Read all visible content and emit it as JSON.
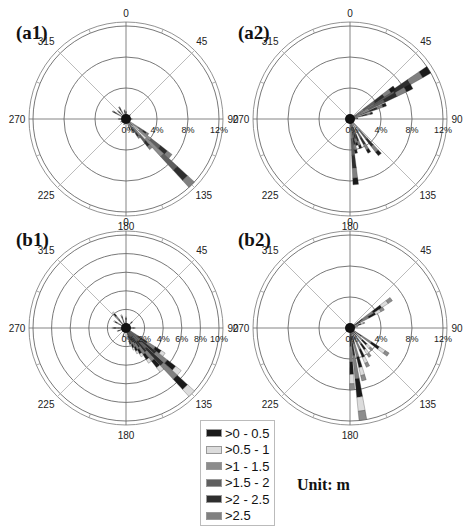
{
  "panels": [
    {
      "id": "a1",
      "label": "(a1)"
    },
    {
      "id": "a2",
      "label": "(a2)"
    },
    {
      "id": "b1",
      "label": "(b1)"
    },
    {
      "id": "b2",
      "label": "(b2)"
    }
  ],
  "legend": {
    "items": [
      {
        "label": ">0 - 0.5",
        "color": "#1a1a1a"
      },
      {
        "label": ">0.5 - 1",
        "color": "#dcdcdc"
      },
      {
        "label": ">1 - 1.5",
        "color": "#8c8c8c"
      },
      {
        "label": ">1.5 - 2",
        "color": "#5f5f5f"
      },
      {
        "label": ">2 - 2.5",
        "color": "#2e2e2e"
      },
      {
        "label": ">2.5",
        "color": "#808080"
      }
    ]
  },
  "unit_label": "Unit: m",
  "chart_data": [
    {
      "type": "rose",
      "title": "(a1)",
      "angle_labels": [
        "0",
        "45",
        "90",
        "135",
        "180",
        "225",
        "270",
        "315"
      ],
      "radial_tick_labels": [
        "0%",
        "4%",
        "8%",
        "12%"
      ],
      "rmax": 12,
      "legend": [
        ">0 - 0.5",
        ">0.5 - 1",
        ">1 - 1.5",
        ">1.5 - 2",
        ">2 - 2.5",
        ">2.5"
      ],
      "dominant_direction_deg": 135,
      "bins": [
        {
          "dir": 135,
          "freq": 12.0
        },
        {
          "dir": 130,
          "freq": 7.5
        },
        {
          "dir": 140,
          "freq": 5.0
        },
        {
          "dir": 125,
          "freq": 3.5
        },
        {
          "dir": 145,
          "freq": 3.0
        },
        {
          "dir": 150,
          "freq": 2.0
        },
        {
          "dir": 160,
          "freq": 1.5
        },
        {
          "dir": 315,
          "freq": 1.5
        },
        {
          "dir": 300,
          "freq": 2.0
        },
        {
          "dir": 330,
          "freq": 1.8
        },
        {
          "dir": 350,
          "freq": 1.2
        },
        {
          "dir": 0,
          "freq": 1.0
        },
        {
          "dir": 270,
          "freq": 1.0
        },
        {
          "dir": 240,
          "freq": 0.8
        },
        {
          "dir": 200,
          "freq": 0.8
        },
        {
          "dir": 45,
          "freq": 0.8
        },
        {
          "dir": 90,
          "freq": 0.8
        }
      ]
    },
    {
      "type": "rose",
      "title": "(a2)",
      "angle_labels": [
        "0",
        "45",
        "90",
        "135",
        "180",
        "225",
        "270",
        "315"
      ],
      "radial_tick_labels": [
        "0%",
        "4%",
        "8%",
        "12%"
      ],
      "rmax": 12,
      "legend": [
        ">0 - 0.5",
        ">0.5 - 1",
        ">1 - 1.5",
        ">1.5 - 2",
        ">2 - 2.5",
        ">2.5"
      ],
      "bins": [
        {
          "dir": 58,
          "freq": 12.0
        },
        {
          "dir": 62,
          "freq": 9.0
        },
        {
          "dir": 55,
          "freq": 7.0
        },
        {
          "dir": 68,
          "freq": 5.0
        },
        {
          "dir": 75,
          "freq": 3.0
        },
        {
          "dir": 85,
          "freq": 1.0
        },
        {
          "dir": 140,
          "freq": 6.0
        },
        {
          "dir": 150,
          "freq": 5.0
        },
        {
          "dir": 160,
          "freq": 4.0
        },
        {
          "dir": 170,
          "freq": 4.5
        },
        {
          "dir": 175,
          "freq": 8.5
        },
        {
          "dir": 165,
          "freq": 3.5
        }
      ]
    },
    {
      "type": "rose",
      "title": "(b1)",
      "angle_labels": [
        "0",
        "45",
        "90",
        "135",
        "180",
        "225",
        "270",
        "315"
      ],
      "radial_tick_labels": [
        "0%",
        "2%",
        "4%",
        "6%",
        "8%",
        "10%"
      ],
      "rmax": 10,
      "legend": [
        ">0 - 0.5",
        ">0.5 - 1",
        ">1 - 1.5",
        ">1.5 - 2",
        ">2 - 2.5",
        ">2.5"
      ],
      "dominant_direction_deg": 135,
      "bins": [
        {
          "dir": 135,
          "freq": 10.0
        },
        {
          "dir": 130,
          "freq": 7.5
        },
        {
          "dir": 140,
          "freq": 6.0
        },
        {
          "dir": 125,
          "freq": 5.0
        },
        {
          "dir": 145,
          "freq": 4.5
        },
        {
          "dir": 150,
          "freq": 3.5
        },
        {
          "dir": 155,
          "freq": 3.0
        },
        {
          "dir": 160,
          "freq": 2.5
        },
        {
          "dir": 165,
          "freq": 2.0
        },
        {
          "dir": 320,
          "freq": 2.2
        },
        {
          "dir": 300,
          "freq": 1.5
        },
        {
          "dir": 340,
          "freq": 1.5
        },
        {
          "dir": 0,
          "freq": 1.2
        },
        {
          "dir": 270,
          "freq": 1.5
        },
        {
          "dir": 250,
          "freq": 1.0
        },
        {
          "dir": 200,
          "freq": 1.0
        },
        {
          "dir": 45,
          "freq": 1.0
        },
        {
          "dir": 90,
          "freq": 1.0
        }
      ]
    },
    {
      "type": "rose",
      "title": "(b2)",
      "angle_labels": [
        "0",
        "45",
        "90",
        "135",
        "180",
        "225",
        "270",
        "315"
      ],
      "radial_tick_labels": [
        "0%",
        "4%",
        "8%",
        "12%"
      ],
      "rmax": 12,
      "legend": [
        ">0 - 0.5",
        ">0.5 - 1",
        ">1 - 1.5",
        ">1.5 - 2",
        ">2 - 2.5",
        ">2.5"
      ],
      "bins": [
        {
          "dir": 55,
          "freq": 6.5
        },
        {
          "dir": 60,
          "freq": 5.0
        },
        {
          "dir": 70,
          "freq": 2.0
        },
        {
          "dir": 80,
          "freq": 1.0
        },
        {
          "dir": 125,
          "freq": 6.0
        },
        {
          "dir": 135,
          "freq": 4.0
        },
        {
          "dir": 145,
          "freq": 4.5
        },
        {
          "dir": 155,
          "freq": 5.5
        },
        {
          "dir": 165,
          "freq": 7.0
        },
        {
          "dir": 172,
          "freq": 12.0
        },
        {
          "dir": 178,
          "freq": 8.0
        }
      ]
    }
  ]
}
